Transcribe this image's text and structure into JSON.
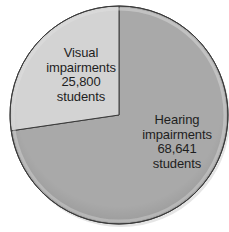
{
  "chart_data": {
    "type": "pie",
    "title": "",
    "categories": [
      "Visual impairments",
      "Hearing impairments"
    ],
    "values": [
      25800,
      68641
    ],
    "unit": "students",
    "start_angle_deg": 0,
    "direction": "counterclockwise-for-first-slice",
    "legend": "none (inline labels)",
    "slices": [
      {
        "name": "Visual impairments",
        "value": 25800,
        "value_label": "25,800",
        "unit_label": "students",
        "color": "#d3d3d3"
      },
      {
        "name": "Hearing impairments",
        "value": 68641,
        "value_label": "68,641",
        "unit_label": "students",
        "color": "#a9a9a9"
      }
    ]
  },
  "labels": {
    "visual": {
      "line1": "Visual",
      "line2": "impairments",
      "line3": "25,800",
      "line4": "students"
    },
    "hearing": {
      "line1": "Hearing",
      "line2": "impairments",
      "line3": "68,641",
      "line4": "students"
    }
  },
  "style": {
    "outline": "#3a3a3a",
    "rim_highlight": "#e6e6e6"
  }
}
